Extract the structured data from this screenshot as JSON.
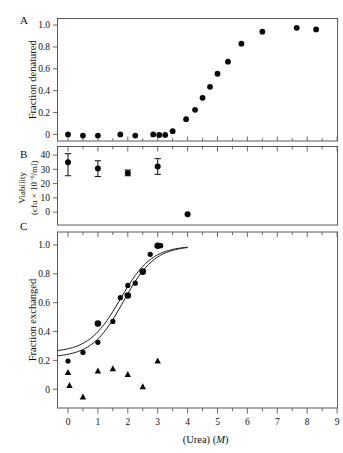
{
  "figure": {
    "xaxis_label_main": "(Urea)",
    "xaxis_label_units": "(M)",
    "x_ticks": [
      "0",
      "1",
      "2",
      "3",
      "4",
      "5",
      "6",
      "7",
      "8",
      "9"
    ],
    "xlim": [
      -0.35,
      9.15
    ]
  },
  "panels": {
    "a": {
      "letter": "A",
      "ylabel": "Fraction denatured",
      "y_ticks": [
        "0",
        "0.2",
        "0.4",
        "0.6",
        "0.8",
        "1.0"
      ],
      "ylim": [
        -0.06,
        1.06
      ]
    },
    "b": {
      "letter": "B",
      "ylabel_line1": "Viability",
      "ylabel_line2_pre": "(cfu ",
      "ylabel_line2_times": "×",
      "ylabel_line2_base": " 10",
      "ylabel_line2_exp": "−6",
      "ylabel_line2_post": "/ml)",
      "y_ticks": [
        "0",
        "10",
        "20",
        "30",
        "40"
      ],
      "ylim": [
        -9,
        46
      ]
    },
    "c": {
      "letter": "C",
      "ylabel": "Fraction exchanged",
      "y_ticks": [
        "0",
        "0.2",
        "0.4",
        "0.6",
        "0.8",
        "1.0"
      ],
      "ylim": [
        -0.13,
        1.09
      ]
    }
  },
  "chart_data": [
    {
      "type": "scatter",
      "panel": "A",
      "title": "A",
      "xlabel": "(Urea) (M)",
      "ylabel": "Fraction denatured",
      "xlim": [
        -0.35,
        9.15
      ],
      "ylim": [
        -0.06,
        1.06
      ],
      "grid": false,
      "legend": "none",
      "series": [
        {
          "name": "fraction denatured",
          "marker": "filled-circle",
          "x": [
            0.0,
            0.5,
            1.0,
            1.75,
            2.25,
            2.85,
            3.05,
            3.25,
            3.5,
            3.95,
            4.25,
            4.5,
            4.75,
            5.0,
            5.35,
            5.8,
            6.5,
            7.65,
            8.3
          ],
          "y": [
            0.0,
            -0.01,
            -0.01,
            0.0,
            -0.01,
            0.0,
            -0.005,
            -0.005,
            0.03,
            0.14,
            0.225,
            0.335,
            0.435,
            0.555,
            0.665,
            0.83,
            0.94,
            0.975,
            0.96
          ]
        }
      ]
    },
    {
      "type": "scatter",
      "panel": "B",
      "title": "B",
      "xlabel": "(Urea) (M)",
      "ylabel": "Viability (cfu × 10−6/ml)",
      "xlim": [
        -0.35,
        9.15
      ],
      "ylim": [
        -9,
        46
      ],
      "grid": false,
      "legend": "none",
      "series": [
        {
          "name": "viability",
          "marker": "filled-circle-errorbar",
          "x": [
            0.0,
            1.0,
            2.0,
            3.0,
            4.0
          ],
          "y": [
            35.0,
            30.5,
            27.5,
            32.0,
            -1.5
          ],
          "yerr_low": [
            9.5,
            5.5,
            2.0,
            5.5,
            0
          ],
          "yerr_high": [
            6.0,
            5.5,
            2.0,
            5.5,
            0
          ]
        }
      ]
    },
    {
      "type": "scatter",
      "panel": "C",
      "title": "C",
      "xlabel": "(Urea) (M)",
      "ylabel": "Fraction exchanged",
      "xlim": [
        -0.35,
        9.15
      ],
      "ylim": [
        -0.13,
        1.09
      ],
      "grid": false,
      "legend": "none",
      "series": [
        {
          "name": "fraction exchanged (circles)",
          "marker": "filled-circle",
          "x": [
            0.0,
            0.5,
            1.0,
            1.0,
            1.5,
            1.75,
            2.0,
            2.0,
            2.25,
            2.5,
            2.75,
            3.0,
            3.1
          ],
          "y": [
            0.195,
            0.255,
            0.325,
            0.455,
            0.47,
            0.635,
            0.65,
            0.72,
            0.735,
            0.815,
            0.935,
            0.995,
            0.995
          ]
        },
        {
          "name": "fraction exchanged (triangles)",
          "marker": "filled-triangle",
          "x": [
            0.0,
            0.05,
            0.5,
            1.0,
            1.5,
            2.0,
            2.5,
            3.0
          ],
          "y": [
            0.115,
            0.025,
            -0.055,
            0.125,
            0.14,
            0.1,
            0.015,
            0.195
          ]
        },
        {
          "name": "fit curve 1",
          "marker": "line",
          "type_hint": "sigmoid-fit",
          "baseline": 0.255,
          "plateau": 0.995,
          "midpoint": 1.75,
          "x_end": 4.0
        },
        {
          "name": "fit curve 2",
          "marker": "line",
          "type_hint": "sigmoid-fit",
          "baseline": 0.22,
          "plateau": 0.995,
          "midpoint": 1.85,
          "x_end": 4.0
        }
      ]
    }
  ]
}
